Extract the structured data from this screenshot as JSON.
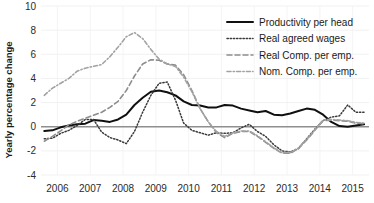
{
  "chart_data": {
    "type": "line",
    "title": "",
    "xlabel": "",
    "ylabel": "Yearly percentage change",
    "xlim": [
      2005.5,
      2015.5
    ],
    "ylim": [
      -4,
      10
    ],
    "yticks": [
      -4,
      -2,
      0,
      2,
      4,
      6,
      8,
      10
    ],
    "ytick_labels": [
      "-4",
      "-2",
      "0",
      "2",
      "4",
      "6",
      "8",
      "10"
    ],
    "xticks": [
      2006,
      2007,
      2008,
      2009,
      2010,
      2011,
      2012,
      2013,
      2014,
      2015
    ],
    "xtick_labels": [
      "2006",
      "2007",
      "2008",
      "2009",
      "2010",
      "2011",
      "2012",
      "2013",
      "2014",
      "2015"
    ],
    "grid": true,
    "zero_line": 0,
    "legend_position": "top-right",
    "x": [
      2005.6,
      2005.85,
      2006.1,
      2006.35,
      2006.6,
      2006.85,
      2007.1,
      2007.35,
      2007.6,
      2007.85,
      2008.1,
      2008.35,
      2008.6,
      2008.85,
      2009.1,
      2009.35,
      2009.6,
      2009.85,
      2010.1,
      2010.35,
      2010.6,
      2010.85,
      2011.1,
      2011.35,
      2011.6,
      2011.85,
      2012.1,
      2012.35,
      2012.6,
      2012.85,
      2013.1,
      2013.35,
      2013.6,
      2013.85,
      2014.1,
      2014.35,
      2014.6,
      2014.85,
      2015.1,
      2015.35
    ],
    "series": [
      {
        "name": "Productivity per head",
        "style": "solid",
        "color": "#101010",
        "width": 2.0,
        "values": [
          -0.35,
          -0.3,
          -0.05,
          0.1,
          0.2,
          0.25,
          0.55,
          0.5,
          0.4,
          0.6,
          1.0,
          1.8,
          2.4,
          2.9,
          3.0,
          2.85,
          2.6,
          2.1,
          1.8,
          1.75,
          1.6,
          1.6,
          1.8,
          1.75,
          1.5,
          1.35,
          1.2,
          1.3,
          1.0,
          0.95,
          1.1,
          1.3,
          1.5,
          1.4,
          1.0,
          0.4,
          0.05,
          0.0,
          0.1,
          0.2
        ]
      },
      {
        "name": "Real agreed wages",
        "style": "dotted",
        "color": "#3a3a3a",
        "width": 1.5,
        "values": [
          -1.0,
          -0.95,
          -0.55,
          -0.3,
          0.1,
          0.6,
          0.6,
          -0.45,
          -0.9,
          -1.1,
          -1.4,
          -0.4,
          1.2,
          2.6,
          3.6,
          3.7,
          2.2,
          0.3,
          -0.3,
          -0.5,
          -0.7,
          -0.5,
          -0.55,
          -0.5,
          -0.1,
          0.2,
          -0.4,
          -0.8,
          -1.5,
          -2.0,
          -2.1,
          -1.8,
          -1.0,
          -0.2,
          0.5,
          0.8,
          0.9,
          1.8,
          1.2,
          1.2
        ]
      },
      {
        "name": "Real Comp. per emp.",
        "style": "dashed",
        "color": "#8d8d8d",
        "width": 1.6,
        "values": [
          -1.2,
          -0.8,
          -0.35,
          0.15,
          0.45,
          0.7,
          0.95,
          1.2,
          1.6,
          2.1,
          3.0,
          4.2,
          5.2,
          5.55,
          5.5,
          5.2,
          5.1,
          4.3,
          3.0,
          1.5,
          0.4,
          -0.5,
          -0.9,
          -0.55,
          -0.4,
          -0.4,
          -0.8,
          -1.3,
          -1.8,
          -2.2,
          -2.2,
          -1.8,
          -1.1,
          -0.3,
          0.5,
          0.55,
          0.5,
          0.45,
          0.3,
          0.25
        ]
      },
      {
        "name": "Nom. Comp. per emp.",
        "style": "dashdot",
        "color": "#a2a2a2",
        "width": 1.6,
        "values": [
          2.6,
          3.2,
          3.6,
          4.0,
          4.6,
          4.85,
          5.0,
          5.15,
          5.8,
          6.6,
          7.45,
          7.8,
          7.3,
          6.4,
          5.6,
          5.2,
          5.0,
          4.1,
          2.9,
          1.5,
          0.4,
          -0.4,
          -0.8,
          -0.5,
          -0.35,
          -0.35,
          -0.75,
          -1.25,
          -1.75,
          -2.15,
          -2.15,
          -1.75,
          -1.05,
          -0.25,
          0.55,
          0.6,
          0.55,
          0.5,
          0.35,
          0.3
        ]
      }
    ]
  },
  "legend": {
    "items": [
      {
        "label": "Productivity per head"
      },
      {
        "label": "Real agreed wages"
      },
      {
        "label": "Real Comp. per emp."
      },
      {
        "label": "Nom. Comp. per emp."
      }
    ]
  }
}
